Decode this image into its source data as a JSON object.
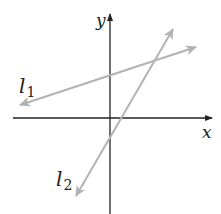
{
  "diagram": {
    "axes": {
      "x_label": "x",
      "y_label": "y",
      "axis_color": "#222222"
    },
    "lines": [
      {
        "name": "l",
        "subscript": "1",
        "color": "#b3b3b3"
      },
      {
        "name": "l",
        "subscript": "2",
        "color": "#b3b3b3"
      }
    ]
  }
}
